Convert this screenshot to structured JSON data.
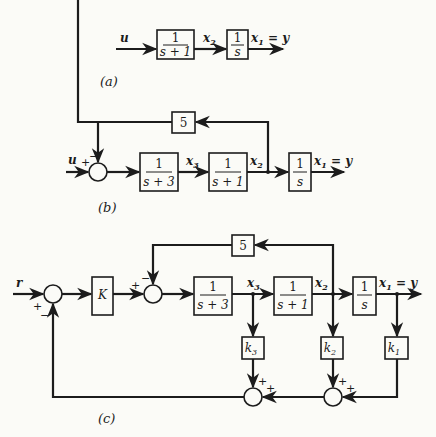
{
  "panels": {
    "a": {
      "label": "(a)",
      "input": "u",
      "blocks": [
        "1/(s+1)",
        "1/s"
      ],
      "signals": {
        "x2": "x",
        "x2_sub": "2",
        "x1": "x",
        "x1_sub": "1",
        "x1_eq": " = y"
      }
    },
    "b": {
      "label": "(b)",
      "input": "u",
      "feedback_gain": "5",
      "sum_signs": {
        "plus": "+",
        "minus": "−"
      },
      "blocks": [
        "1/(s+3)",
        "1/(s+1)",
        "1/s"
      ],
      "signals": {
        "x3": "x",
        "x3_sub": "3",
        "x2": "x",
        "x2_sub": "2",
        "x1": "x",
        "x1_sub": "1",
        "x1_eq": " = y"
      }
    },
    "c": {
      "label": "(c)",
      "input": "r",
      "gain": "K",
      "feedback_gain": "5",
      "sum_signs": {
        "plus": "+",
        "minus": "−"
      },
      "blocks": [
        "1/(s+3)",
        "1/(s+1)",
        "1/s"
      ],
      "state_gains": [
        {
          "name": "k",
          "sub": "3"
        },
        {
          "name": "k",
          "sub": "2"
        },
        {
          "name": "k",
          "sub": "1"
        }
      ],
      "signals": {
        "x3": "x",
        "x3_sub": "3",
        "x2": "x",
        "x2_sub": "2",
        "x1": "x",
        "x1_sub": "1",
        "x1_eq": " = y"
      }
    }
  },
  "text": {
    "one": "1",
    "s": "s",
    "s_plus_1": "s + 1",
    "s_plus_3": "s + 3"
  }
}
